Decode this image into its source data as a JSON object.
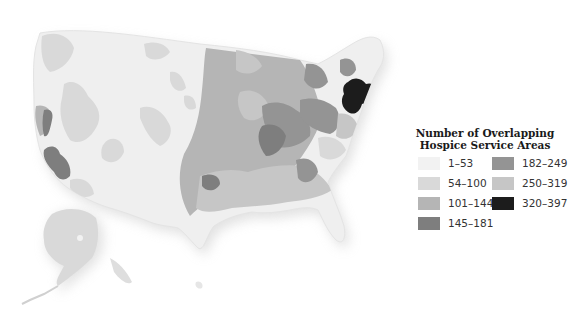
{
  "legend": {
    "title_line1": "Number of Overlapping",
    "title_line2": "Hospice Service Areas",
    "items": [
      {
        "label": "1–53",
        "color": "#f2f2f2"
      },
      {
        "label": "54–100",
        "color": "#d9d9d9"
      },
      {
        "label": "101–144",
        "color": "#b5b5b5"
      },
      {
        "label": "145–181",
        "color": "#7e7e7e"
      },
      {
        "label": "182–249",
        "color": "#949494"
      },
      {
        "label": "250–319",
        "color": "#c6c6c6"
      },
      {
        "label": "320–397",
        "color": "#1c1c1c"
      }
    ]
  },
  "map": {
    "subject": "United States incl. Alaska and Hawaii",
    "base_color": "#efefef",
    "shadow_color": "#d0d0d0"
  }
}
